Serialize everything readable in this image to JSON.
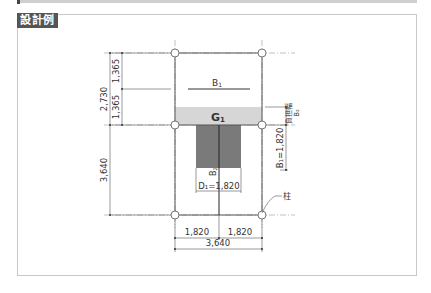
{
  "header": {
    "label": "設計例"
  },
  "diagram": {
    "beam_labels": {
      "b1": "B",
      "b1_sub": "1",
      "g1": "G",
      "g1_sub": "1",
      "b2": "B",
      "b2_sub": "2"
    },
    "left_dims": {
      "total_top": "2,730",
      "upper": "1,365",
      "lower": "1,365",
      "bottom_span": "3,640"
    },
    "bottom_dims": {
      "left": "1,820",
      "right": "1,820",
      "total": "3,640"
    },
    "right_dims": {
      "b1_width": "B₁=1,820",
      "burden_label": "負担幅",
      "burden_symbol": "B₂"
    },
    "inner_dim": {
      "d1": "D₁=1,820"
    },
    "column_label": "柱",
    "colors": {
      "band": "#d6d6d6",
      "block": "#7a7a7a",
      "line": "#555555",
      "header_bg": "#555555"
    }
  }
}
